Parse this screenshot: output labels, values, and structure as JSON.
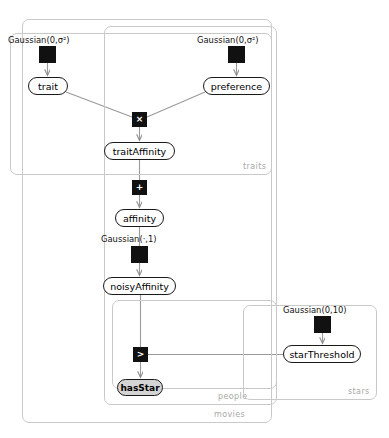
{
  "diagram": {
    "type": "factor-graph",
    "title_fragment": "",
    "plates": [
      {
        "id": "movies",
        "label": "movies",
        "x": 22,
        "y": 19,
        "w": 250,
        "h": 404,
        "label_x": 214,
        "label_y": 410
      },
      {
        "id": "people",
        "label": "people",
        "x": 104,
        "y": 26,
        "w": 173,
        "h": 379,
        "label_x": 218,
        "label_y": 392
      },
      {
        "id": "traits",
        "label": "traits",
        "x": 10,
        "y": 33,
        "w": 262,
        "h": 142,
        "label_x": 243,
        "label_y": 162
      },
      {
        "id": "inner-people",
        "label": "",
        "x": 112,
        "y": 300,
        "w": 165,
        "h": 89,
        "label_x": 0,
        "label_y": 0
      },
      {
        "id": "stars",
        "label": "stars",
        "x": 243,
        "y": 305,
        "w": 134,
        "h": 95,
        "label_x": 348,
        "label_y": 387
      }
    ],
    "variable_nodes": [
      {
        "id": "trait",
        "label": "trait",
        "x": 28,
        "y": 77,
        "w": 40,
        "h": 18,
        "observed": false
      },
      {
        "id": "preference",
        "label": "preference",
        "x": 203,
        "y": 77,
        "w": 67,
        "h": 18,
        "observed": false
      },
      {
        "id": "traitAffinity",
        "label": "traitAffinity",
        "x": 104,
        "y": 142,
        "w": 71,
        "h": 18,
        "observed": false
      },
      {
        "id": "affinity",
        "label": "affinity",
        "x": 115,
        "y": 209,
        "w": 49,
        "h": 18,
        "observed": false
      },
      {
        "id": "noisyAffinity",
        "label": "noisyAffinity",
        "x": 103,
        "y": 277,
        "w": 73,
        "h": 18,
        "observed": false
      },
      {
        "id": "starThreshold",
        "label": "starThreshold",
        "x": 283,
        "y": 345,
        "w": 78,
        "h": 18,
        "observed": false
      },
      {
        "id": "hasStar",
        "label": "hasStar",
        "x": 117,
        "y": 379,
        "w": 46,
        "h": 17,
        "observed": true
      }
    ],
    "factor_nodes": [
      {
        "id": "gaussian-trait",
        "symbol": "",
        "x": 39,
        "y": 46,
        "w": 17,
        "h": 17
      },
      {
        "id": "gaussian-preference",
        "symbol": "",
        "x": 228,
        "y": 46,
        "w": 17,
        "h": 17
      },
      {
        "id": "product",
        "symbol": "×",
        "x": 132,
        "y": 112,
        "w": 15,
        "h": 15
      },
      {
        "id": "sum",
        "symbol": "+",
        "x": 132,
        "y": 180,
        "w": 15,
        "h": 15
      },
      {
        "id": "gaussian-noise",
        "symbol": "",
        "x": 131,
        "y": 246,
        "w": 17,
        "h": 17
      },
      {
        "id": "gaussian-threshold",
        "symbol": "",
        "x": 314,
        "y": 316,
        "w": 17,
        "h": 17
      },
      {
        "id": "greater-than",
        "symbol": ">",
        "x": 133,
        "y": 347,
        "w": 15,
        "h": 15
      }
    ],
    "distribution_labels": [
      {
        "id": "label-gaussian-trait",
        "text": "Gaussian(0,σ²)",
        "x": 8,
        "y": 35
      },
      {
        "id": "label-gaussian-preference",
        "text": "Gaussian(0,σ²)",
        "x": 197,
        "y": 35
      },
      {
        "id": "label-gaussian-noise",
        "text": "Gaussian(·,1)",
        "x": 101,
        "y": 234
      },
      {
        "id": "label-gaussian-threshold",
        "text": "Gaussian(0,10)",
        "x": 283,
        "y": 305
      }
    ],
    "colors": {
      "plate_border": "#c9c9c9",
      "plate_label": "#a8a8a8",
      "node_border": "#1a1a1a",
      "node_fill": "#ffffff",
      "observed_fill": "#d4d4d4",
      "factor_fill": "#111111",
      "edge": "#9a9a9a",
      "text": "#000000"
    },
    "edges": [
      {
        "id": "edge-gtrait-trait",
        "from": "gaussian-trait",
        "to": "trait",
        "arrow": true
      },
      {
        "id": "edge-gpref-preference",
        "from": "gaussian-preference",
        "to": "preference",
        "arrow": true
      },
      {
        "id": "edge-trait-product",
        "from": "trait",
        "to": "product",
        "arrow": false
      },
      {
        "id": "edge-preference-product",
        "from": "preference",
        "to": "product",
        "arrow": false
      },
      {
        "id": "edge-product-traitaffinity",
        "from": "product",
        "to": "traitAffinity",
        "arrow": true
      },
      {
        "id": "edge-traitaffinity-sum",
        "from": "traitAffinity",
        "to": "sum",
        "arrow": false
      },
      {
        "id": "edge-sum-affinity",
        "from": "sum",
        "to": "affinity",
        "arrow": true
      },
      {
        "id": "edge-affinity-gnoise",
        "from": "affinity",
        "to": "gaussian-noise",
        "arrow": false
      },
      {
        "id": "edge-gnoise-noisyaffinity",
        "from": "gaussian-noise",
        "to": "noisyAffinity",
        "arrow": true
      },
      {
        "id": "edge-noisyaffinity-gt",
        "from": "noisyAffinity",
        "to": "greater-than",
        "arrow": false
      },
      {
        "id": "edge-gthreshold-starthreshold",
        "from": "gaussian-threshold",
        "to": "starThreshold",
        "arrow": true
      },
      {
        "id": "edge-starthreshold-gt",
        "from": "starThreshold",
        "to": "greater-than",
        "arrow": false
      },
      {
        "id": "edge-gt-hasstar",
        "from": "greater-than",
        "to": "hasStar",
        "arrow": true
      }
    ]
  }
}
